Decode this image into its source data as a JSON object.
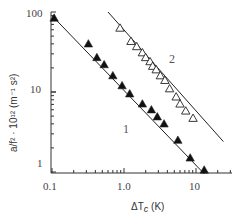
{
  "chart_data": {
    "type": "scatter",
    "title": "",
    "xlabel": "ΔT_c (K)",
    "ylabel": "a/f²·10¹² (m⁻¹ s²)",
    "xscale": "log",
    "yscale": "log",
    "xlim": [
      0.1,
      30
    ],
    "ylim": [
      0.85,
      100
    ],
    "x_ticks": [
      "0.1",
      "1.0",
      "10"
    ],
    "y_ticks": [
      "1",
      "10",
      "100"
    ],
    "grid": false,
    "legend": "none (series labelled inline '1' and '2')",
    "series": [
      {
        "name": "1",
        "marker": "filled-triangle",
        "fit_line": {
          "x": [
            0.1,
            13
          ],
          "y": [
            90,
            0.95
          ]
        },
        "x": [
          0.107,
          0.32,
          0.42,
          0.53,
          0.7,
          0.94,
          1.2,
          1.8,
          2.4,
          2.9,
          3.6,
          5.6,
          8.3,
          13
        ],
        "y": [
          84,
          40,
          27,
          22,
          16,
          12,
          9.5,
          7.1,
          6.0,
          4.9,
          4.0,
          2.5,
          1.5,
          1.06
        ]
      },
      {
        "name": "2",
        "marker": "open-triangle",
        "fit_line": {
          "x": [
            0.6,
            24
          ],
          "y": [
            100,
            2.4
          ]
        },
        "x": [
          0.88,
          1.25,
          1.5,
          1.8,
          2.0,
          2.3,
          2.5,
          2.8,
          3.2,
          3.7,
          4.3,
          5.3,
          6.0,
          7.2,
          9.1
        ],
        "y": [
          63,
          43,
          37,
          31,
          27,
          24,
          21,
          19,
          16,
          14,
          11,
          8.7,
          7.1,
          5.8,
          4.7
        ]
      }
    ],
    "annotations": [
      {
        "text": "1",
        "near_series": "1"
      },
      {
        "text": "2",
        "near_series": "2"
      }
    ]
  },
  "labels": {
    "x_axis": "ΔT",
    "x_axis_sub": "c",
    "x_axis_unit": " (K)",
    "y_axis": "a/f² · 10¹² (m⁻¹ s²)",
    "series1": "1",
    "series2": "2",
    "xt0": "0.1",
    "xt1": "1.0",
    "xt2": "10",
    "yt0": "1",
    "yt1": "10",
    "yt2": "100"
  }
}
